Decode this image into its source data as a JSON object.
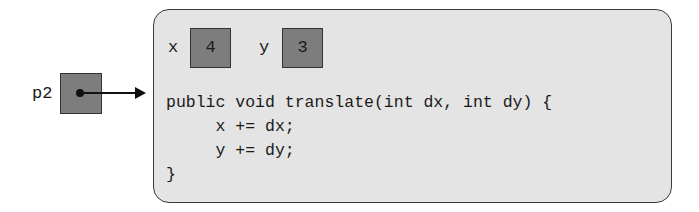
{
  "reference": {
    "name": "p2"
  },
  "object": {
    "fields": [
      {
        "name": "x",
        "value": "4"
      },
      {
        "name": "y",
        "value": "3"
      }
    ],
    "method_code": [
      "public void translate(int dx, int dy) {",
      "     x += dx;",
      "     y += dy;",
      "}"
    ]
  },
  "colors": {
    "cell_fill": "#7d7d7d",
    "object_fill": "#e4e4e4",
    "stroke": "#333333"
  }
}
